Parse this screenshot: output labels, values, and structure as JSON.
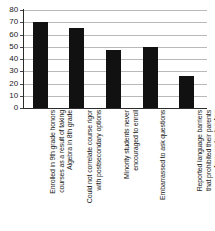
{
  "chart_data": {
    "type": "bar",
    "title": "",
    "subtitle": "",
    "xlabel": "",
    "ylabel": "",
    "ylim": [
      0,
      80
    ],
    "ytick_step": 10,
    "yticks": [
      80,
      70,
      60,
      50,
      40,
      30,
      20,
      10,
      0
    ],
    "grid": true,
    "legend": false,
    "legend_position": "none",
    "orientation": "vertical",
    "bar_color": "#111111",
    "gridline_color": "#b9b9b9",
    "axis_color": "#2b2b2b",
    "categories": [
      "Enrolled in 9th grade honors courses as a result of taking Algebra in 8th grade",
      "Could not correlate course rigor with postsecondary options",
      "Minority students never encouraged to enroll",
      "Embarrassed to ask questions",
      "Reported language barriers that prohibited their parents from understanding"
    ],
    "category_lines": [
      [
        "Enrolled in 9th grade honors",
        "courses as a result of taking",
        "Algebra in 8th grade"
      ],
      [
        "Could not correlate course rigor",
        "with postsecondary options"
      ],
      [
        "Minority students never",
        "encouraged to enroll"
      ],
      [
        "Embarrassed to ask questions"
      ],
      [
        "Reported language barriers",
        "that prohibited their parents",
        "from understanding"
      ]
    ],
    "values": [
      70,
      65,
      47,
      50,
      26
    ]
  }
}
